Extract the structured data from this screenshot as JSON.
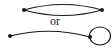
{
  "diagram": {
    "separator_text": "or",
    "stroke_color": "#1a1a1a",
    "top_graph": {
      "description": "two vertices joined by two parallel edges",
      "vertices": 2,
      "edges": 2
    },
    "bottom_graph": {
      "description": "edge between two vertices with a loop at the right vertex",
      "vertices": 2,
      "edges": 1,
      "loops": 1
    }
  }
}
